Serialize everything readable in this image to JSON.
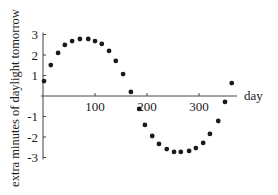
{
  "chart_data": {
    "type": "scatter",
    "title": "",
    "xlabel": "day",
    "ylabel": "extra minutes of daylight tomorrow",
    "xlim": [
      0,
      375
    ],
    "ylim": [
      -3,
      3
    ],
    "x_ticks": [
      100,
      200,
      300
    ],
    "x_tick_labels": [
      "100",
      "200",
      "300"
    ],
    "y_ticks": [
      3,
      2,
      1,
      -1,
      -2,
      -3
    ],
    "y_tick_labels": [
      "3",
      "2",
      "1",
      "-1",
      "-2",
      "-3"
    ],
    "grid": false,
    "legend": null,
    "marker_color": "#1a1a1a",
    "series": [
      {
        "name": "daylight change",
        "x": [
          2,
          15,
          29,
          42,
          56,
          71,
          87,
          100,
          113,
          127,
          140,
          154,
          169,
          185,
          196,
          210,
          223,
          238,
          252,
          265,
          281,
          294,
          308,
          321,
          337,
          350,
          363
        ],
        "y": [
          0.73,
          1.51,
          2.1,
          2.49,
          2.68,
          2.78,
          2.78,
          2.68,
          2.54,
          2.2,
          1.71,
          1.07,
          0.2,
          -0.63,
          -1.41,
          -1.95,
          -2.34,
          -2.59,
          -2.73,
          -2.73,
          -2.68,
          -2.54,
          -2.29,
          -1.85,
          -1.22,
          -0.29,
          0.63
        ]
      }
    ]
  }
}
